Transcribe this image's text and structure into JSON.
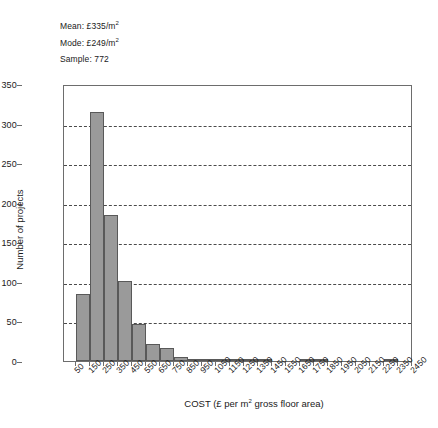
{
  "chart_data": {
    "type": "bar",
    "title": "",
    "xlabel": "COST (£ per m² gross floor area)",
    "ylabel": "Number of projects",
    "ylim": [
      0,
      350
    ],
    "ytick_values": [
      0,
      50,
      100,
      150,
      200,
      250,
      300,
      350
    ],
    "ytick_labels": [
      "0",
      "50",
      "100",
      "150",
      "200",
      "250",
      "300",
      "350"
    ],
    "grid": "horizontal-dashed",
    "legend": "none",
    "categories": [
      "50",
      "150",
      "250",
      "350",
      "450",
      "550",
      "650",
      "750",
      "850",
      "950",
      "1050",
      "1150",
      "1250",
      "1350",
      "1450",
      "1550",
      "1650",
      "1750",
      "1850",
      "1950",
      "2050",
      "2150",
      "2250",
      "2350",
      "2450"
    ],
    "values": [
      85,
      315,
      185,
      101,
      47,
      22,
      17,
      5,
      3,
      2,
      1,
      1,
      1,
      1,
      0,
      0,
      1,
      1,
      0,
      0,
      0,
      0,
      2,
      0,
      0
    ],
    "bar_color": "#9a9a9a",
    "bar_edge_color": "#595959",
    "annotations": [
      {
        "label": "Mean:",
        "value": "£335/m",
        "exponent": "2"
      },
      {
        "label": "Mode:",
        "value": "£249/m",
        "exponent": "2"
      },
      {
        "label": "Sample:",
        "value": "772",
        "exponent": ""
      }
    ]
  },
  "axis_title": {
    "x_prefix": "COST (£ per m",
    "x_exponent": "2",
    "x_suffix": " gross floor area)",
    "y": "Number of projects"
  }
}
